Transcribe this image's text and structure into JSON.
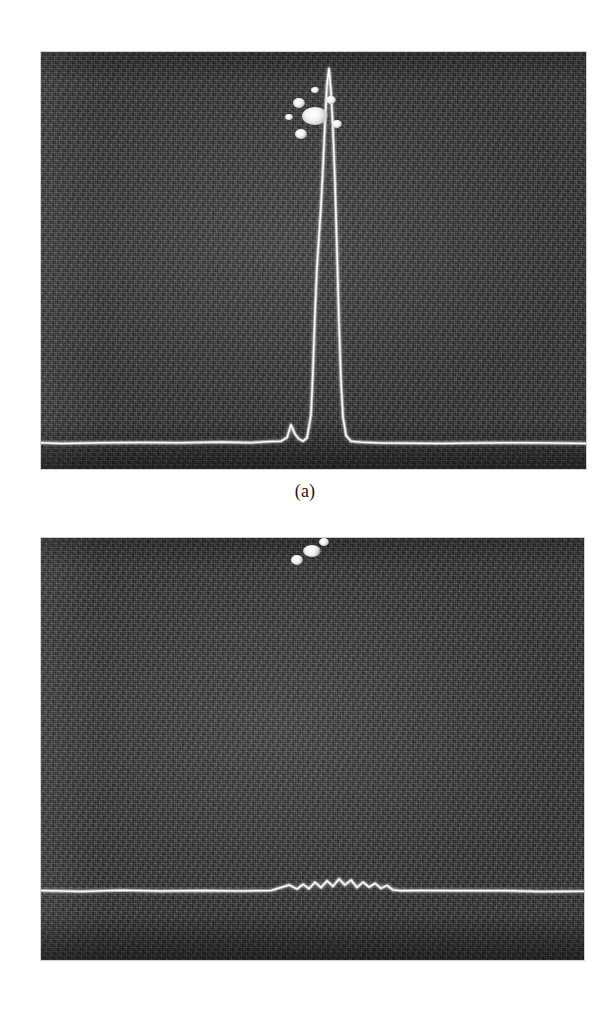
{
  "figure": {
    "kind": "two-panel-photograph-figure",
    "background_color": "#ffffff",
    "width": 610,
    "height": 1026,
    "panels": [
      {
        "id": "a",
        "caption": "(a)",
        "photo": {
          "description": "oscilloscope/spectrum-analyzer screen photograph, dark grainy background with a bright horizontal baseline trace and one tall narrow vertical peak",
          "background_color": "#3b3b3b",
          "trace_color": "#f5f5f5",
          "left": 41,
          "top": 52,
          "width": 545,
          "height": 417
        },
        "blemishes": [
          {
            "cx": 315,
            "cy": 116,
            "rx": 13,
            "ry": 9
          },
          {
            "cx": 299,
            "cy": 103,
            "rx": 6,
            "ry": 5
          },
          {
            "cx": 331,
            "cy": 100,
            "rx": 5,
            "ry": 4
          },
          {
            "cx": 337,
            "cy": 124,
            "rx": 5,
            "ry": 4
          },
          {
            "cx": 301,
            "cy": 134,
            "rx": 6,
            "ry": 5
          },
          {
            "cx": 315,
            "cy": 90,
            "rx": 4,
            "ry": 3
          },
          {
            "cx": 289,
            "cy": 117,
            "rx": 4,
            "ry": 3
          }
        ]
      },
      {
        "id": "b",
        "caption": "(b)",
        "photo": {
          "description": "oscilloscope/spectrum-analyzer screen photograph, dark grainy background with an essentially flat bright baseline trace showing only a small noisy ripple near the centre",
          "background_color": "#3b3b3b",
          "trace_color": "#f5f5f5",
          "left": 41,
          "top": 538,
          "width": 543,
          "height": 422
        },
        "blemishes": [
          {
            "cx": 312,
            "cy": 551,
            "rx": 9,
            "ry": 6
          },
          {
            "cx": 297,
            "cy": 560,
            "rx": 6,
            "ry": 5
          },
          {
            "cx": 324,
            "cy": 542,
            "rx": 5,
            "ry": 4
          }
        ]
      }
    ]
  },
  "chart_data": [
    {
      "type": "line",
      "panel": "a",
      "title": "(a)",
      "xlabel": "",
      "ylabel": "",
      "xlim": [
        0,
        545
      ],
      "ylim": [
        0,
        1
      ],
      "grid": false,
      "legend": null,
      "series": [
        {
          "name": "swept-frequency response with strong carrier peak",
          "x": [
            0,
            20,
            60,
            100,
            140,
            180,
            210,
            230,
            240,
            246,
            250,
            254,
            258,
            262,
            266,
            270,
            272,
            274,
            276,
            278,
            280,
            282,
            284,
            286,
            288,
            290,
            292,
            294,
            296,
            298,
            300,
            302,
            305,
            310,
            320,
            340,
            360,
            400,
            440,
            480,
            520,
            545
          ],
          "y": [
            0.015,
            0.016,
            0.015,
            0.017,
            0.016,
            0.018,
            0.017,
            0.019,
            0.02,
            0.03,
            0.065,
            0.04,
            0.025,
            0.022,
            0.03,
            0.09,
            0.21,
            0.36,
            0.48,
            0.56,
            0.64,
            0.74,
            0.86,
            0.96,
            1.0,
            0.94,
            0.84,
            0.7,
            0.52,
            0.33,
            0.18,
            0.085,
            0.035,
            0.02,
            0.017,
            0.016,
            0.017,
            0.016,
            0.016,
            0.017,
            0.016,
            0.016
          ]
        }
      ],
      "annotations": [
        {
          "text": "main peak apex",
          "x": 288,
          "y": 1.0
        },
        {
          "text": "left sidelobe",
          "x": 250,
          "y": 0.065
        },
        {
          "text": "right sidelobe",
          "x": 302,
          "y": 0.085
        }
      ]
    },
    {
      "type": "line",
      "panel": "b",
      "title": "(b)",
      "xlabel": "",
      "ylabel": "",
      "xlim": [
        0,
        543
      ],
      "ylim": [
        0,
        1
      ],
      "grid": false,
      "legend": null,
      "series": [
        {
          "name": "swept-frequency response with carrier suppressed (noise floor only)",
          "x": [
            0,
            40,
            80,
            120,
            160,
            200,
            230,
            240,
            248,
            256,
            262,
            268,
            274,
            280,
            286,
            292,
            298,
            304,
            310,
            316,
            322,
            328,
            334,
            340,
            346,
            352,
            360,
            380,
            420,
            460,
            500,
            543
          ],
          "y": [
            0.012,
            0.012,
            0.013,
            0.012,
            0.013,
            0.012,
            0.014,
            0.022,
            0.03,
            0.018,
            0.034,
            0.02,
            0.038,
            0.024,
            0.044,
            0.026,
            0.05,
            0.03,
            0.046,
            0.022,
            0.04,
            0.024,
            0.036,
            0.02,
            0.028,
            0.015,
            0.013,
            0.012,
            0.012,
            0.013,
            0.012,
            0.012
          ]
        }
      ],
      "annotations": [
        {
          "text": "small noise ripple region",
          "x": 310,
          "y": 0.05
        }
      ]
    }
  ]
}
